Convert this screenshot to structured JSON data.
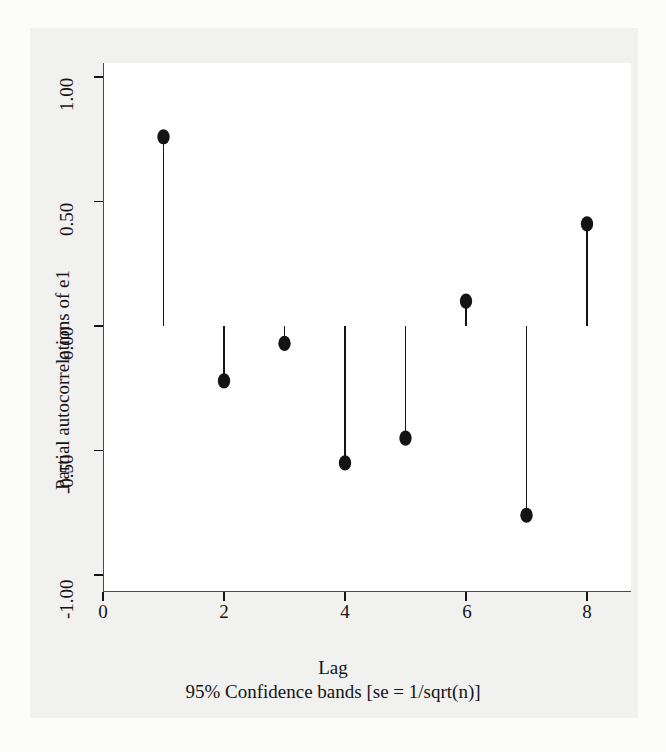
{
  "figure": {
    "background_color": "#fcfcfb",
    "graph_region_color": "#f1f1ef",
    "plot_area_color": "#ffffff",
    "ink_color": "#141414"
  },
  "chart_data": {
    "type": "bar",
    "plot_style": "stem-spike",
    "title": "",
    "subtitle": "",
    "xlabel": "Lag",
    "ylabel": "Partial autocorrelations of e1",
    "note": "95% Confidence bands [se = 1/sqrt(n)]",
    "categories": [
      1,
      2,
      3,
      4,
      5,
      6,
      7,
      8
    ],
    "values": [
      0.76,
      -0.22,
      -0.07,
      -0.55,
      -0.45,
      0.1,
      -0.76,
      0.41
    ],
    "x": [
      1,
      2,
      3,
      4,
      5,
      6,
      7,
      8
    ],
    "xlim": [
      0,
      8.4
    ],
    "ylim": [
      -1.0,
      1.0
    ],
    "xticks": [
      0,
      2,
      4,
      6,
      8
    ],
    "xticklabels": [
      "0",
      "2",
      "4",
      "6",
      "8"
    ],
    "yticks": [
      1.0,
      0.5,
      0.0,
      -0.5,
      -1.0
    ],
    "yticklabels": [
      "1.00",
      "0.50",
      "0.00",
      "-0.50",
      "-1.00"
    ],
    "grid": false,
    "legend": null,
    "baseline": 0.0,
    "marker": "filled-circle",
    "marker_color": "#141414",
    "stem_color": "#141414",
    "series": [
      {
        "name": "Partial autocorrelations of e1",
        "values": [
          0.76,
          -0.22,
          -0.07,
          -0.55,
          -0.45,
          0.1,
          -0.76,
          0.41
        ]
      }
    ]
  }
}
